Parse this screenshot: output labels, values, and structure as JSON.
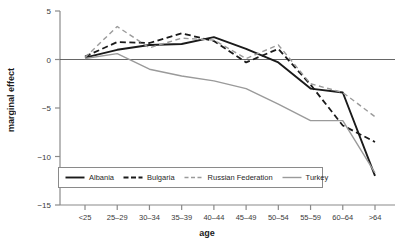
{
  "chart_data": {
    "type": "line",
    "title": "",
    "xlabel": "age",
    "ylabel": "marginal effect",
    "categories": [
      "<25",
      "25–29",
      "30–34",
      "35–39",
      "40–44",
      "45–49",
      "50–54",
      "55–59",
      "60–64",
      ">64"
    ],
    "ylim": [
      -15,
      5
    ],
    "yticks": [
      5,
      0,
      -5,
      -10,
      -15
    ],
    "ytick_labels": [
      "5",
      "0",
      "−5",
      "−10",
      "−15"
    ],
    "grid": false,
    "zero_line": true,
    "legend_position": "bottom-left-inside",
    "series": [
      {
        "name": "Albania",
        "color": "#1a1a1a",
        "style": "solid",
        "width": 1.9,
        "values": [
          0.2,
          1.0,
          1.5,
          1.6,
          2.3,
          1.1,
          -0.3,
          -3.0,
          -3.4,
          -12.0
        ]
      },
      {
        "name": "Bulgaria",
        "color": "#1a1a1a",
        "style": "dashed",
        "width": 1.8,
        "values": [
          0.3,
          1.8,
          1.7,
          2.7,
          1.9,
          -0.3,
          1.1,
          -2.6,
          -6.8,
          -8.5
        ]
      },
      {
        "name": "Russian Federation",
        "color": "#9a9a9a",
        "style": "dashed",
        "width": 1.4,
        "values": [
          0.2,
          3.4,
          1.2,
          2.2,
          2.0,
          0.1,
          1.5,
          -2.5,
          -3.4,
          -5.9
        ]
      },
      {
        "name": "Turkey",
        "color": "#9a9a9a",
        "style": "solid",
        "width": 1.4,
        "values": [
          0.1,
          0.6,
          -1.0,
          -1.7,
          -2.2,
          -3.0,
          -4.6,
          -6.3,
          -6.3,
          -11.7
        ]
      }
    ]
  },
  "axes": {
    "axis_color": "#8a8a8a",
    "text_color": "#3a3a3a"
  }
}
